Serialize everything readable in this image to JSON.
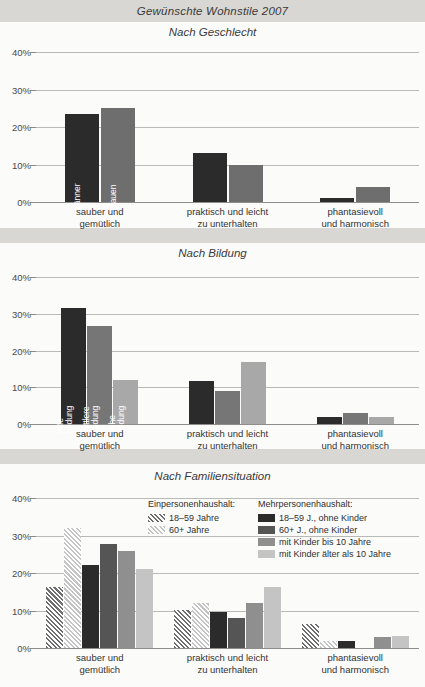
{
  "suptitle": "Gewünschte Wohnstile 2007",
  "colors": {
    "page_bg": "#d9d7d3",
    "panel_bg": "#fbfbfa",
    "dark": "#2b2b2b",
    "mid_dark": "#4a4a4a",
    "mid": "#6e6e6e",
    "mid_light": "#8f8f8f",
    "light": "#a8a8a8",
    "lighter": "#c4c4c4",
    "grid": "#b9b9b7",
    "axis": "#8d8d8b",
    "text": "#2b2b2b"
  },
  "categories": [
    [
      "sauber und",
      "gemütlich"
    ],
    [
      "praktisch und leicht",
      "zu unterhalten"
    ],
    [
      "phantasievoll",
      "und harmonisch"
    ]
  ],
  "yticks": [
    "0%",
    "10%",
    "20%",
    "30%",
    "40%"
  ],
  "legend": {
    "col1": {
      "head": "Einpersonenhaushalt:",
      "items": [
        {
          "label": "18–59 Jahre",
          "fill": "#6e6e6e",
          "hatch": true
        },
        {
          "label": "60+ Jahre",
          "fill": "#c4c4c4",
          "hatch": true
        }
      ]
    },
    "col2": {
      "head": "Mehrpersonenhaushalt:",
      "items": [
        {
          "label": "18–59 J., ohne Kinder",
          "fill": "#2b2b2b",
          "hatch": false
        },
        {
          "label": "60+ J., ohne Kinder",
          "fill": "#555555",
          "hatch": false
        },
        {
          "label": "mit Kinder bis 10 Jahre",
          "fill": "#8f8f8f",
          "hatch": false
        },
        {
          "label": "mit Kinder älter als 10 Jahre",
          "fill": "#c4c4c4",
          "hatch": false
        }
      ]
    }
  },
  "chart_data": [
    {
      "type": "bar",
      "title": "Nach Geschlecht",
      "xlabel": "",
      "ylabel": "",
      "ylim": [
        0,
        40
      ],
      "yticks": [
        0,
        10,
        20,
        30,
        40
      ],
      "ytick_labels": [
        "0%",
        "10%",
        "20%",
        "30%",
        "40%"
      ],
      "grid": true,
      "legend_position": "in-bar",
      "categories": [
        "sauber und gemütlich",
        "praktisch und leicht zu unterhalten",
        "phantasievoll und harmonisch"
      ],
      "series": [
        {
          "name": "Männer",
          "fill": "#2b2b2b",
          "hatch": false,
          "values": [
            23.5,
            13.0,
            1.0
          ]
        },
        {
          "name": "Frouen",
          "fill": "#6e6e6e",
          "hatch": false,
          "values": [
            25.2,
            10.0,
            4.0
          ]
        }
      ],
      "in_bar_labels": [
        "Männer",
        "Frauen"
      ]
    },
    {
      "type": "bar",
      "title": "Nach Bildung",
      "xlabel": "",
      "ylabel": "",
      "ylim": [
        0,
        40
      ],
      "yticks": [
        0,
        10,
        20,
        30,
        40
      ],
      "ytick_labels": [
        "0%",
        "10%",
        "20%",
        "30%",
        "40%"
      ],
      "grid": true,
      "legend_position": "in-bar",
      "categories": [
        "sauber und gemütlich",
        "praktisch und leicht zu unterhalten",
        "phantasievoll und harmonisch"
      ],
      "series": [
        {
          "name": "tiefe Bildung",
          "fill": "#2b2b2b",
          "hatch": false,
          "values": [
            31.5,
            11.7,
            2.0
          ]
        },
        {
          "name": "mittlere Bildung",
          "fill": "#767676",
          "hatch": false,
          "values": [
            26.8,
            8.9,
            3.1
          ]
        },
        {
          "name": "hohe Bildung",
          "fill": "#a8a8a8",
          "hatch": false,
          "values": [
            12.0,
            16.8,
            2.0
          ]
        }
      ],
      "in_bar_labels": [
        "tiefe Bildung",
        "mittlere Bildung",
        "hohe Bildung"
      ]
    },
    {
      "type": "bar",
      "title": "Nach Familiensituation",
      "xlabel": "",
      "ylabel": "",
      "ylim": [
        0,
        40
      ],
      "yticks": [
        0,
        10,
        20,
        30,
        40
      ],
      "ytick_labels": [
        "0%",
        "10%",
        "20%",
        "30%",
        "40%"
      ],
      "grid": true,
      "legend_position": "top-right",
      "categories": [
        "sauber und gemütlich",
        "praktisch und leicht zu unterhalten",
        "phantasievoll und harmonisch"
      ],
      "series": [
        {
          "name": "Einpersonenhaushalt: 18–59 Jahre",
          "fill": "#6e6e6e",
          "hatch": true,
          "values": [
            16.4,
            10.1,
            6.4
          ]
        },
        {
          "name": "Einpersonenhaushalt: 60+ Jahre",
          "fill": "#c4c4c4",
          "hatch": true,
          "values": [
            32.0,
            12.0,
            1.9
          ]
        },
        {
          "name": "Mehrpersonenhaushalt: 18–59 J., ohne Kinder",
          "fill": "#2b2b2b",
          "hatch": false,
          "values": [
            22.2,
            9.7,
            1.8
          ]
        },
        {
          "name": "Mehrpersonenhaushalt: 60+ J., ohne Kinder",
          "fill": "#555555",
          "hatch": false,
          "values": [
            27.8,
            7.9,
            0.0
          ]
        },
        {
          "name": "Mehrpersonenhaushalt: mit Kinder bis 10 Jahre",
          "fill": "#8f8f8f",
          "hatch": false,
          "values": [
            25.9,
            12.0,
            3.0
          ]
        },
        {
          "name": "Mehrpersonenhaushalt: mit Kinder älter als 10 Jahre",
          "fill": "#c4c4c4",
          "hatch": false,
          "values": [
            21.1,
            16.3,
            3.2
          ]
        }
      ]
    }
  ]
}
